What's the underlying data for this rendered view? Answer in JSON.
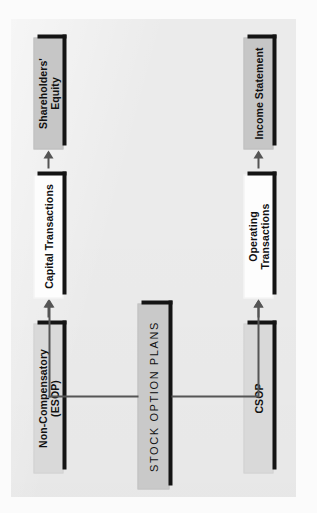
{
  "diagram": {
    "orientation": "rotated-90-ccw",
    "root": {
      "id": "stock-option-plans",
      "label": "STOCK OPTION PLANS",
      "style": "uppercase-letterspaced",
      "fill": "#c9c9c9",
      "shadow": "#141414"
    },
    "branches": [
      {
        "id": "branch-compensatory",
        "nodes": [
          {
            "id": "csop",
            "label": "CSOP",
            "fill": "#d9d9d9"
          },
          {
            "id": "operating-transactions",
            "label": "Operating Transactions",
            "fill": "#fdfdfd"
          },
          {
            "id": "income-statement",
            "label": "Income Statement",
            "fill": "#c6c6c6"
          }
        ]
      },
      {
        "id": "branch-non-compensatory",
        "nodes": [
          {
            "id": "non-compensatory-esop",
            "label": "Non-Compensatory (ESOP)",
            "fill": "#d9d9d9"
          },
          {
            "id": "capital-transactions",
            "label": "Capital Transactions",
            "fill": "#fdfdfd"
          },
          {
            "id": "shareholders-equity",
            "label": "Shareholders' Equity",
            "fill": "#c6c6c6"
          }
        ]
      }
    ],
    "connectors": [
      {
        "id": "root-to-csop",
        "type": "elbow-arrow"
      },
      {
        "id": "root-to-esop",
        "type": "elbow-arrow"
      },
      {
        "id": "csop-to-operating",
        "type": "straight-arrow"
      },
      {
        "id": "operating-to-income",
        "type": "straight-arrow"
      },
      {
        "id": "esop-to-capital",
        "type": "straight-arrow"
      },
      {
        "id": "capital-to-equity",
        "type": "straight-arrow"
      }
    ],
    "colors": {
      "page": "#ebebeb",
      "outer": "#fbfbfb",
      "shadow": "#141414",
      "arrow": "#555555",
      "text": "#111111"
    }
  }
}
